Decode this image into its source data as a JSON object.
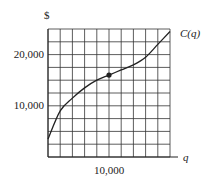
{
  "chart_data": {
    "type": "line",
    "title": "",
    "xlabel": "q",
    "ylabel": "$",
    "series": [
      {
        "name": "C(q)",
        "x": [
          0,
          2000,
          4000,
          6000,
          8000,
          10000,
          12000,
          14000,
          16000,
          18000,
          20000
        ],
        "values": [
          3500,
          9000,
          11500,
          13500,
          15000,
          16000,
          17000,
          18000,
          19500,
          22000,
          24500
        ]
      }
    ],
    "highlight_point": {
      "x": 10000,
      "y": 16000
    },
    "xlim": [
      0,
      20000
    ],
    "ylim": [
      0,
      25000
    ],
    "x_ticks": [
      {
        "value": 10000,
        "label": "10,000"
      }
    ],
    "y_ticks": [
      {
        "value": 10000,
        "label": "10,000"
      },
      {
        "value": 20000,
        "label": "20,000"
      }
    ],
    "grid": true,
    "grid_x_step": 2000,
    "grid_y_step": 2500,
    "legend": "inline label at curve end"
  },
  "labels": {
    "y_axis": "$",
    "x_axis": "q",
    "curve": "C(q)",
    "y_tick_20000": "20,000",
    "y_tick_10000": "10,000",
    "x_tick_10000": "10,000"
  }
}
